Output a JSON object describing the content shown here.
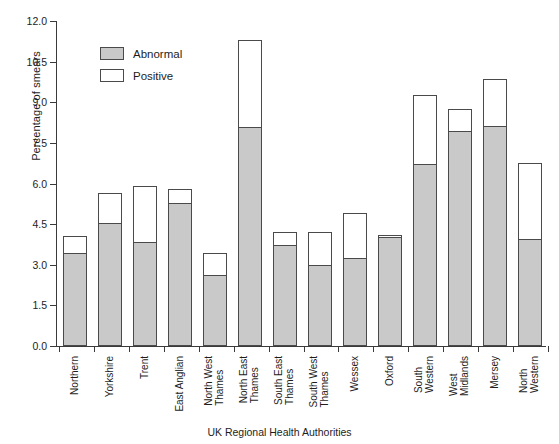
{
  "chart_data": {
    "type": "bar",
    "subtype": "stacked-bar",
    "title": "",
    "xlabel": "UK Regional Health Authorities",
    "ylabel": "Percentage of smears",
    "ylim": [
      0.0,
      12.0
    ],
    "yticks": [
      "0.0",
      "1.5",
      "3.0",
      "4.5",
      "6.0",
      "7.5",
      "9.0",
      "10.5",
      "12.0"
    ],
    "ytick_values": [
      0.0,
      1.5,
      3.0,
      4.5,
      6.0,
      7.5,
      9.0,
      10.5,
      12.0
    ],
    "grid": false,
    "legend_position": "upper-left-inside",
    "categories": [
      "Northern",
      "Yorkshire",
      "Trent",
      "East Anglian",
      "North West Thames",
      "North East Thames",
      "South East Thames",
      "South West Thames",
      "Wessex",
      "Oxford",
      "South Western",
      "West Midlands",
      "Mersey",
      "North Western"
    ],
    "category_lines": [
      [
        "Northern"
      ],
      [
        "Yorkshire"
      ],
      [
        "Trent"
      ],
      [
        "East Anglian"
      ],
      [
        "North West",
        "Thames"
      ],
      [
        "North East",
        "Thames"
      ],
      [
        "South East",
        "Thames"
      ],
      [
        "South West",
        "Thames"
      ],
      [
        "Wessex"
      ],
      [
        "Oxford"
      ],
      [
        "South",
        "Western"
      ],
      [
        "West",
        "Midlands"
      ],
      [
        "Mersey"
      ],
      [
        "North",
        "Western"
      ]
    ],
    "series": [
      {
        "name": "Abnormal",
        "color": "#c9c9c9",
        "values": [
          3.4,
          4.5,
          3.8,
          5.25,
          2.6,
          8.05,
          3.7,
          2.95,
          3.2,
          4.0,
          6.7,
          7.9,
          8.1,
          3.9
        ]
      },
      {
        "name": "Positive",
        "color": "#ffffff",
        "values": [
          4.05,
          5.65,
          5.9,
          5.8,
          3.45,
          11.3,
          4.2,
          4.2,
          4.9,
          4.1,
          9.25,
          8.75,
          9.85,
          6.75
        ],
        "note": "cumulative bar total (top of stacked bar)"
      }
    ]
  },
  "legend": {
    "items": [
      {
        "label": "Abnormal",
        "swatch": "gray-filled-rect"
      },
      {
        "label": "Positive",
        "swatch": "white-outlined-rect"
      }
    ]
  },
  "colors": {
    "abnormal_fill": "#c9c9c9",
    "positive_fill": "#ffffff",
    "outline": "#4a4a4a",
    "axis": "#3a3a3a",
    "text": "#1d1d1d",
    "background": "#ffffff"
  }
}
